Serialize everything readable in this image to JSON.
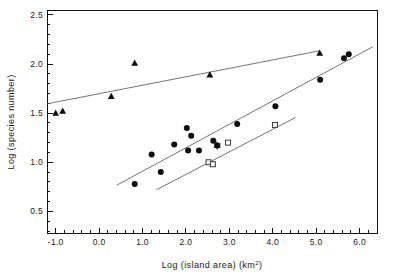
{
  "chart_data": {
    "type": "scatter",
    "title": "",
    "xlabel": "Log (island area) (km2)",
    "xlabel_parts": {
      "main": "Log (island area) (km",
      "sup": "2",
      "tail": ")"
    },
    "ylabel": "Log (species number)",
    "xlim": [
      -1.2,
      6.4
    ],
    "ylim": [
      0.28,
      2.55
    ],
    "xticks": [
      -1.0,
      0.0,
      1.0,
      2.0,
      3.0,
      4.0,
      5.0,
      6.0
    ],
    "xticklabels": [
      "-1.0",
      "0.0",
      "1.0",
      "2.0",
      "3.0",
      "4.0",
      "5.0",
      "6.0"
    ],
    "yticks": [
      0.5,
      1.0,
      1.5,
      2.0,
      2.5
    ],
    "yticklabels": [
      "0.5",
      "1.0",
      "1.5",
      "2.0",
      "2.5"
    ],
    "x_minor_step": 0.2,
    "y_minor_step": 0.1,
    "grid": false,
    "legend": "none",
    "series": [
      {
        "name": "triangles",
        "marker": "filled-triangle",
        "points": [
          {
            "x": -1.0,
            "y": 1.5
          },
          {
            "x": -0.84,
            "y": 1.52
          },
          {
            "x": 0.28,
            "y": 1.67
          },
          {
            "x": 0.82,
            "y": 2.01
          },
          {
            "x": 2.55,
            "y": 1.89
          },
          {
            "x": 5.08,
            "y": 2.11
          }
        ]
      },
      {
        "name": "filled-circles",
        "marker": "filled-circle",
        "points": [
          {
            "x": 0.82,
            "y": 0.78
          },
          {
            "x": 1.21,
            "y": 1.08
          },
          {
            "x": 1.42,
            "y": 0.9
          },
          {
            "x": 1.73,
            "y": 1.18
          },
          {
            "x": 2.02,
            "y": 1.35
          },
          {
            "x": 2.05,
            "y": 1.12
          },
          {
            "x": 2.12,
            "y": 1.27
          },
          {
            "x": 2.3,
            "y": 1.12
          },
          {
            "x": 2.63,
            "y": 1.22
          },
          {
            "x": 2.72,
            "y": 1.17
          },
          {
            "x": 3.18,
            "y": 1.39
          },
          {
            "x": 4.06,
            "y": 1.57
          },
          {
            "x": 5.09,
            "y": 1.84
          },
          {
            "x": 5.64,
            "y": 2.06
          },
          {
            "x": 5.75,
            "y": 2.1
          }
        ]
      },
      {
        "name": "open-squares",
        "marker": "open-square",
        "points": [
          {
            "x": 2.52,
            "y": 1.0
          },
          {
            "x": 2.62,
            "y": 0.98
          },
          {
            "x": 2.97,
            "y": 1.2
          },
          {
            "x": 4.05,
            "y": 1.38
          }
        ]
      },
      {
        "name": "star",
        "marker": "asterisk",
        "points": [
          {
            "x": 2.72,
            "y": 1.17
          }
        ]
      }
    ],
    "fit_lines": [
      {
        "name": "upper-regression-triangles",
        "x_start": -1.2,
        "y_start": 1.595,
        "x_end": 5.08,
        "y_end": 2.135
      },
      {
        "name": "middle-regression-circles",
        "x_start": 0.4,
        "y_start": 0.765,
        "x_end": 6.3,
        "y_end": 2.175
      },
      {
        "name": "lower-regression-squares",
        "x_start": 1.32,
        "y_start": 0.72,
        "x_end": 4.52,
        "y_end": 1.455
      }
    ]
  },
  "figure": {
    "caption": ""
  }
}
